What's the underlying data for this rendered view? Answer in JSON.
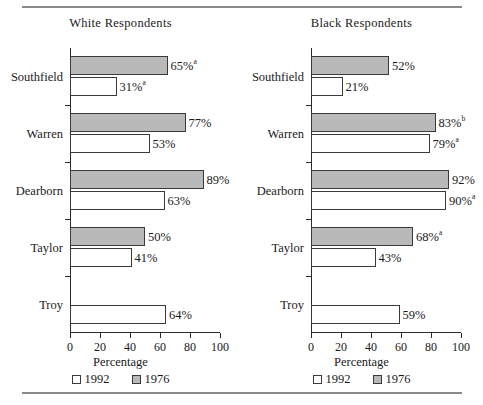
{
  "figure": {
    "top_rule": true,
    "bottom_rule": true
  },
  "chart_data": {
    "type": "bar",
    "orientation": "horizontal",
    "title": "",
    "xlabel": "Percentage",
    "ylabel": "",
    "xlim": [
      0,
      100
    ],
    "xticks": [
      0,
      20,
      40,
      60,
      80,
      100
    ],
    "grid": false,
    "legend_position": "bottom-center",
    "legend": [
      "1992",
      "1976"
    ],
    "colors": {
      "1992": "#ffffff",
      "1976": "#b9b9b9",
      "outline": "#3a3a3a",
      "rule": "#8a8a8a"
    },
    "panels": [
      {
        "title": "White Respondents",
        "categories": [
          "Southfield",
          "Warren",
          "Dearborn",
          "Taylor",
          "Troy"
        ],
        "series": [
          {
            "name": "1976",
            "values": [
              65,
              77,
              89,
              50,
              null
            ],
            "labels": [
              "65%",
              "77%",
              "89%",
              "50%",
              ""
            ],
            "footnotes": [
              "a",
              "",
              "",
              "",
              ""
            ]
          },
          {
            "name": "1992",
            "values": [
              31,
              53,
              63,
              41,
              64
            ],
            "labels": [
              "31%",
              "53%",
              "63%",
              "41%",
              "64%"
            ],
            "footnotes": [
              "a",
              "",
              "",
              "",
              ""
            ]
          }
        ]
      },
      {
        "title": "Black Respondents",
        "categories": [
          "Southfield",
          "Warren",
          "Dearborn",
          "Taylor",
          "Troy"
        ],
        "series": [
          {
            "name": "1976",
            "values": [
              52,
              83,
              92,
              68,
              null
            ],
            "labels": [
              "52%",
              "83%",
              "92%",
              "68%",
              ""
            ],
            "footnotes": [
              "",
              "b",
              "",
              "a",
              ""
            ]
          },
          {
            "name": "1992",
            "values": [
              21,
              79,
              90,
              43,
              59
            ],
            "labels": [
              "21%",
              "79%",
              "90%",
              "43%",
              "59%"
            ],
            "footnotes": [
              "",
              "a",
              "a",
              "",
              ""
            ]
          }
        ]
      }
    ]
  }
}
